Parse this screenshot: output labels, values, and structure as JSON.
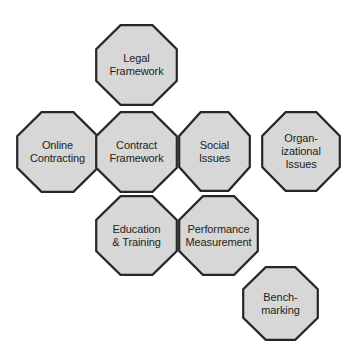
{
  "diagram": {
    "background_color": "#ffffff",
    "node_fill_color": "#d7d7d7",
    "node_border_color": "#262626",
    "node_text_color": "#1d1d1d",
    "nodes": [
      {
        "id": "legal-framework",
        "label": "Legal\nFramework",
        "row": 1,
        "x": 95,
        "y": 24,
        "width": 83,
        "height": 82
      },
      {
        "id": "online-contracting",
        "label": "Online\nContracting",
        "row": 2,
        "x": 16,
        "y": 111,
        "width": 83,
        "height": 82
      },
      {
        "id": "contract-framework",
        "label": "Contract\nFramework",
        "row": 2,
        "x": 95,
        "y": 111,
        "width": 83,
        "height": 82
      },
      {
        "id": "social-issues",
        "label": "Social\nIssues",
        "row": 2,
        "x": 178,
        "y": 111,
        "width": 73,
        "height": 81
      },
      {
        "id": "organizational-issues",
        "label": "Organ-\nizational\nIssues",
        "row": 2,
        "x": 261,
        "y": 111,
        "width": 80,
        "height": 81
      },
      {
        "id": "education-training",
        "label": "Education\n& Training",
        "row": 3,
        "x": 95,
        "y": 195,
        "width": 83,
        "height": 81
      },
      {
        "id": "performance-measurement",
        "label": "Performance\nMeasurement",
        "row": 3,
        "x": 178,
        "y": 195,
        "width": 81,
        "height": 81
      },
      {
        "id": "benchmarking",
        "label": "Bench-\nmarking",
        "row": 4,
        "x": 242,
        "y": 266,
        "width": 77,
        "height": 75
      }
    ]
  }
}
